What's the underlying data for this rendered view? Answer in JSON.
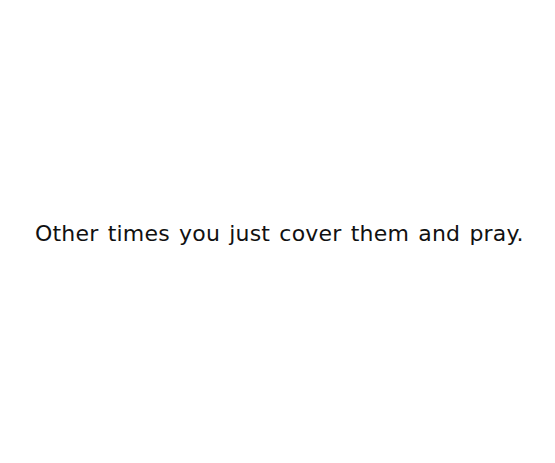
{
  "page": {
    "background_color": "#ffffff",
    "text_color": "#111111",
    "caption": "Other times you just cover them and pray."
  }
}
